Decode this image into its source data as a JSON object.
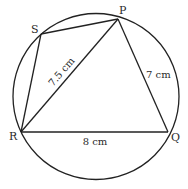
{
  "diagram": {
    "type": "cyclic-quadrilateral",
    "circle": {
      "cx": 96,
      "cy": 96.5,
      "r": 83
    },
    "stroke_color": "#222222",
    "vertices": [
      {
        "id": "P",
        "label": "P",
        "x": 118,
        "y": 19,
        "label_x": 119,
        "label_y": 14
      },
      {
        "id": "S",
        "label": "S",
        "x": 41,
        "y": 34,
        "label_x": 31,
        "label_y": 33
      },
      {
        "id": "R",
        "label": "R",
        "x": 21,
        "y": 132,
        "label_x": 9,
        "label_y": 140
      },
      {
        "id": "Q",
        "label": "Q",
        "x": 168,
        "y": 132,
        "label_x": 171,
        "label_y": 141
      }
    ],
    "segments": [
      {
        "from": "S",
        "to": "P"
      },
      {
        "from": "S",
        "to": "R"
      },
      {
        "from": "R",
        "to": "P"
      },
      {
        "from": "P",
        "to": "Q"
      },
      {
        "from": "R",
        "to": "Q"
      }
    ],
    "measurements": [
      {
        "segment": "RP",
        "text": "7.5 cm"
      },
      {
        "segment": "PQ",
        "text": "7 cm"
      },
      {
        "segment": "RQ",
        "text": "8 cm"
      }
    ]
  }
}
